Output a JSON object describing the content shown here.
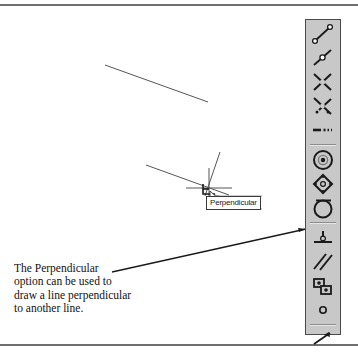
{
  "figure": {
    "kind": "cad-osnap-illustration",
    "caption_lines": [
      "The Perpendicular",
      "option can be used to",
      "draw a line perpendicular",
      "to another line."
    ]
  },
  "tooltip": {
    "label": "Perpendicular"
  },
  "colors": {
    "toolbar_face": "#c8c8c8",
    "toolbar_border": "#4a4a4a",
    "line_stroke": "#555555",
    "leader_stroke": "#1a1a1a",
    "rule": "#6e6e6e",
    "tooltip_border": "#3a3a3a",
    "tooltip_bg": "#ffffff"
  },
  "drawing": {
    "existing_line": {
      "x1": 105,
      "y1": 57,
      "x2": 208,
      "y2": 94
    },
    "base_line": {
      "x1": 146,
      "y1": 157,
      "x2": 228,
      "y2": 187
    },
    "rubber_band_line": {
      "x1": 219,
      "y1": 145,
      "x2": 206,
      "y2": 186
    },
    "crosshair": {
      "cx": 209,
      "cy": 183
    },
    "snap_marker": "perpendicular-glyph",
    "cursor": "arrow-pointer"
  },
  "leader": {
    "from": {
      "x": 112,
      "y": 264
    },
    "to": {
      "x": 305,
      "y": 221
    }
  },
  "toolbar": {
    "name": "Object Snap toolbar",
    "items": [
      {
        "icon": "snap-endpoint-icon",
        "label": "Snap to Endpoint"
      },
      {
        "icon": "snap-midpoint-icon",
        "label": "Snap to Midpoint"
      },
      {
        "icon": "snap-intersection-icon",
        "label": "Snap to Intersection"
      },
      {
        "icon": "snap-apparent-intersect-icon",
        "label": "Snap to Apparent Intersect"
      },
      {
        "icon": "snap-extension-icon",
        "label": "Snap to Extension"
      },
      {
        "icon": "separator",
        "label": ""
      },
      {
        "icon": "snap-center-icon",
        "label": "Snap to Center"
      },
      {
        "icon": "snap-quadrant-icon",
        "label": "Snap to Quadrant"
      },
      {
        "icon": "snap-tangent-icon",
        "label": "Snap to Tangent"
      },
      {
        "icon": "separator",
        "label": ""
      },
      {
        "icon": "snap-perpendicular-icon",
        "label": "Snap to Perpendicular"
      },
      {
        "icon": "snap-parallel-icon",
        "label": "Snap to Parallel"
      },
      {
        "icon": "snap-insert-icon",
        "label": "Snap to Insert"
      },
      {
        "icon": "snap-node-icon",
        "label": "Snap to Node"
      },
      {
        "icon": "separator",
        "label": ""
      },
      {
        "icon": "snap-nearest-icon",
        "label": "Snap to Nearest"
      }
    ]
  }
}
